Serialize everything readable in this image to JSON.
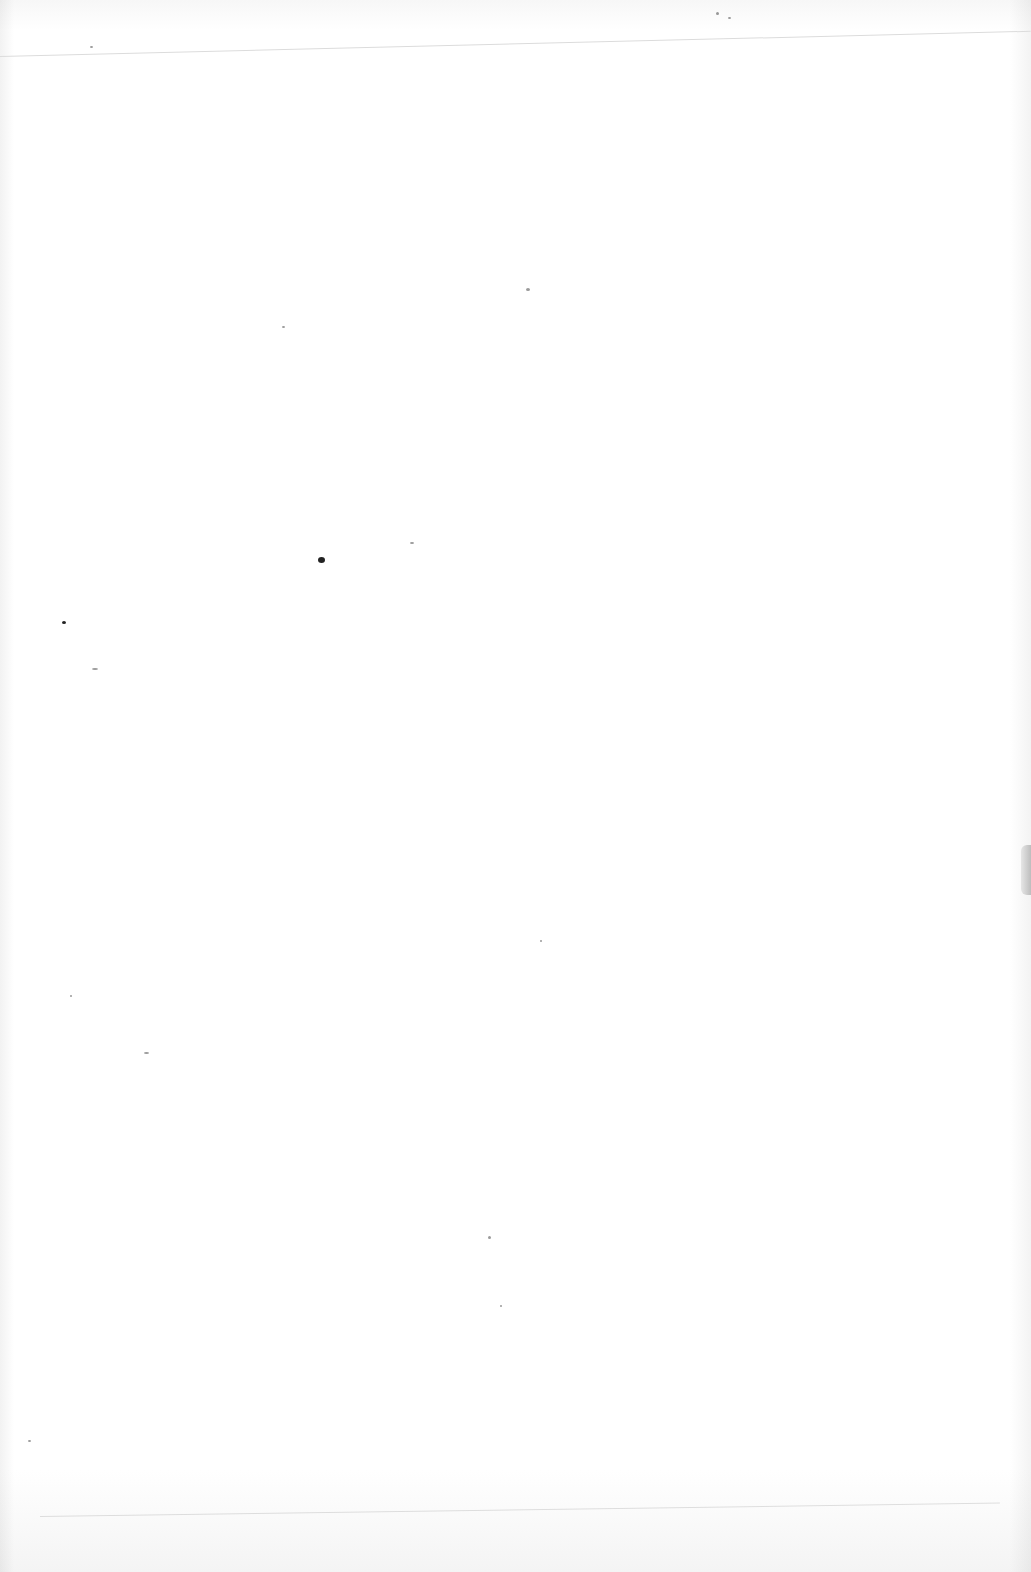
{
  "page": {
    "type": "blank scanned page",
    "text_content": "",
    "colors": {
      "paper": "#fdfdfd",
      "rule": "#dcdcdc",
      "edge_shadow": "#bdbdbd",
      "speck": "#222222"
    }
  }
}
